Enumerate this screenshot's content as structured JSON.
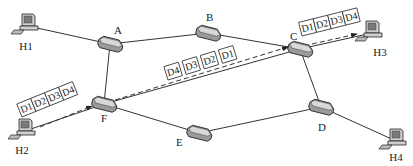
{
  "diagram": {
    "type": "network-topology",
    "hosts": [
      {
        "id": "H1",
        "label": "H1",
        "x": 28,
        "y": 26,
        "lx": 26,
        "ly": 50
      },
      {
        "id": "H2",
        "label": "H2",
        "x": 25,
        "y": 131,
        "lx": 22,
        "ly": 154
      },
      {
        "id": "H3",
        "label": "H3",
        "x": 372,
        "y": 33,
        "lx": 380,
        "ly": 56
      },
      {
        "id": "H4",
        "label": "H4",
        "x": 396,
        "y": 141,
        "lx": 396,
        "ly": 161
      }
    ],
    "routers": [
      {
        "id": "A",
        "label": "A",
        "x": 110,
        "y": 44,
        "lx": 114,
        "ly": 34
      },
      {
        "id": "B",
        "label": "B",
        "x": 208,
        "y": 33,
        "lx": 206,
        "ly": 21
      },
      {
        "id": "C",
        "label": "C",
        "x": 300,
        "y": 49,
        "lx": 290,
        "ly": 40
      },
      {
        "id": "D",
        "label": "D",
        "x": 321,
        "y": 107,
        "lx": 318,
        "ly": 131
      },
      {
        "id": "E",
        "label": "E",
        "x": 199,
        "y": 133,
        "lx": 176,
        "ly": 146
      },
      {
        "id": "F",
        "label": "F",
        "x": 104,
        "y": 104,
        "lx": 101,
        "ly": 122
      }
    ],
    "links": [
      {
        "from": "H1",
        "to": "A"
      },
      {
        "from": "A",
        "to": "B"
      },
      {
        "from": "B",
        "to": "C"
      },
      {
        "from": "A",
        "to": "F"
      },
      {
        "from": "F",
        "to": "C"
      },
      {
        "from": "F",
        "to": "E"
      },
      {
        "from": "E",
        "to": "D"
      },
      {
        "from": "C",
        "to": "D"
      },
      {
        "from": "C",
        "to": "H3"
      },
      {
        "from": "D",
        "to": "H4"
      },
      {
        "from": "H2",
        "to": "F"
      }
    ],
    "flows": [
      {
        "id": "h2-to-f",
        "from": [
          40,
          127
        ],
        "to": [
          92,
          106
        ],
        "packets": [
          "D1",
          "D2",
          "D3",
          "D4"
        ]
      },
      {
        "id": "f-to-c",
        "from": [
          115,
          100
        ],
        "to": [
          288,
          47
        ],
        "packets": [
          "D4",
          "D3",
          "D2",
          "D1"
        ]
      },
      {
        "id": "c-to-h3",
        "from": [
          312,
          44
        ],
        "to": [
          357,
          34
        ],
        "packets": [
          "D1",
          "D2",
          "D3",
          "D4"
        ]
      }
    ],
    "packet_groups": [
      {
        "id": "pkts-h2-f",
        "x": 22,
        "y": 117,
        "angle": -22,
        "labels": [
          "D1",
          "D2",
          "D3",
          "D4"
        ],
        "style": "joined"
      },
      {
        "id": "pkts-f-c",
        "x": 168,
        "y": 80,
        "angle": -17,
        "labels": [
          "D4",
          "D3",
          "D2",
          "D1"
        ],
        "style": "separate"
      },
      {
        "id": "pkts-c-h3",
        "x": 302,
        "y": 36,
        "angle": -14,
        "labels": [
          "D1",
          "D2",
          "D3",
          "D4"
        ],
        "style": "joined"
      }
    ]
  },
  "colors": {
    "line": "#333333",
    "router_body": "#9a9a9a",
    "router_top": "#d8d8d8",
    "pc_body": "#cfcfcf",
    "pc_screen": "#7a7a7a",
    "background": "#ffffff"
  }
}
